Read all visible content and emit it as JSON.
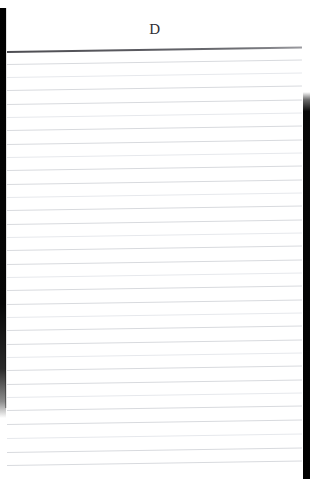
{
  "document": {
    "type": "scanned-ruled-notebook-page",
    "background_color": "#ffffff",
    "width": 310,
    "height": 479,
    "header": {
      "letter": "D",
      "color": "#2d2d33",
      "align": "center"
    },
    "edges": {
      "left_strip": {
        "name": "left-scan-edge",
        "color": "#000000",
        "x": 0,
        "y": 8,
        "width": 6,
        "height": 410
      },
      "right_strip": {
        "name": "right-scan-edge",
        "color": "#000000",
        "x": 303,
        "y": 92,
        "width": 7,
        "height": 387
      }
    },
    "rules": {
      "count": 32,
      "first_line_y": 51,
      "spacing": 13.3,
      "slant_degrees": -0.85,
      "left_x": 7,
      "right_x": 302,
      "heavy_line_color": "#55555b",
      "light_line_color": "#d8dade",
      "faint_line_color": "#e6e8ec",
      "lines": [
        {
          "y": 51,
          "weight": "heavy"
        },
        {
          "y": 64,
          "weight": "light"
        },
        {
          "y": 77,
          "weight": "faint"
        },
        {
          "y": 90,
          "weight": "light"
        },
        {
          "y": 104,
          "weight": "light"
        },
        {
          "y": 117,
          "weight": "faint"
        },
        {
          "y": 130,
          "weight": "light"
        },
        {
          "y": 144,
          "weight": "light"
        },
        {
          "y": 157,
          "weight": "faint"
        },
        {
          "y": 170,
          "weight": "light"
        },
        {
          "y": 184,
          "weight": "light"
        },
        {
          "y": 197,
          "weight": "faint"
        },
        {
          "y": 210,
          "weight": "light"
        },
        {
          "y": 224,
          "weight": "light"
        },
        {
          "y": 237,
          "weight": "faint"
        },
        {
          "y": 250,
          "weight": "light"
        },
        {
          "y": 264,
          "weight": "light"
        },
        {
          "y": 277,
          "weight": "faint"
        },
        {
          "y": 290,
          "weight": "light"
        },
        {
          "y": 304,
          "weight": "light"
        },
        {
          "y": 317,
          "weight": "faint"
        },
        {
          "y": 330,
          "weight": "light"
        },
        {
          "y": 344,
          "weight": "light"
        },
        {
          "y": 357,
          "weight": "faint"
        },
        {
          "y": 370,
          "weight": "light"
        },
        {
          "y": 384,
          "weight": "light"
        },
        {
          "y": 397,
          "weight": "faint"
        },
        {
          "y": 410,
          "weight": "light"
        },
        {
          "y": 424,
          "weight": "light"
        },
        {
          "y": 438,
          "weight": "faint"
        },
        {
          "y": 452,
          "weight": "light"
        },
        {
          "y": 465,
          "weight": "light"
        }
      ]
    }
  }
}
